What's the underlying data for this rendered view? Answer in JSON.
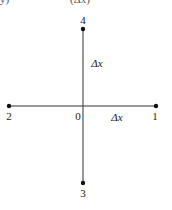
{
  "header_fragment": {
    "left": "y)",
    "center": "(Δx)"
  },
  "diagram": {
    "center": {
      "label": "0",
      "x": 83,
      "y": 106
    },
    "points": [
      {
        "label": "1",
        "x": 156,
        "y": 106
      },
      {
        "label": "2",
        "x": 9,
        "y": 106
      },
      {
        "label": "3",
        "x": 83,
        "y": 183
      },
      {
        "label": "4",
        "x": 83,
        "y": 29
      }
    ],
    "spacing_labels": {
      "horizontal": "Δx",
      "vertical": "Δx"
    }
  },
  "colors": {
    "line": "#333333",
    "dot": "#111111",
    "background": "#ffffff"
  }
}
